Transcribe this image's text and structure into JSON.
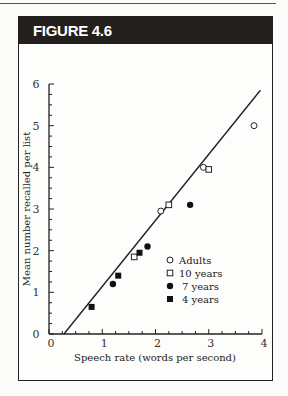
{
  "figure": {
    "label": "FIGURE 4.6"
  },
  "chart_data": {
    "type": "scatter",
    "title": "",
    "xlabel": "Speech rate (words per second)",
    "ylabel": "Mean number recalled per list",
    "xlim": [
      0,
      4
    ],
    "ylim": [
      0,
      6
    ],
    "xticks": [
      "0",
      "1",
      "2",
      "3",
      "4"
    ],
    "yticks": [
      "0",
      "1",
      "2",
      "3",
      "4",
      "5",
      "6"
    ],
    "grid": false,
    "legend_position": "lower right",
    "series": [
      {
        "name": "Adults",
        "marker": "open-circle",
        "points": [
          [
            2.1,
            2.95
          ],
          [
            2.9,
            4.0
          ],
          [
            3.85,
            5.0
          ]
        ]
      },
      {
        "name": "10 years",
        "marker": "open-square",
        "points": [
          [
            1.6,
            1.85
          ],
          [
            2.25,
            3.1
          ],
          [
            3.0,
            3.95
          ]
        ]
      },
      {
        "name": "7 years",
        "marker": "filled-circle",
        "points": [
          [
            1.2,
            1.2
          ],
          [
            1.85,
            2.1
          ],
          [
            2.65,
            3.1
          ]
        ]
      },
      {
        "name": "4 years",
        "marker": "filled-square",
        "points": [
          [
            0.8,
            0.65
          ],
          [
            1.3,
            1.4
          ],
          [
            1.7,
            1.95
          ]
        ]
      }
    ],
    "fit_line": {
      "from": [
        0.28,
        0
      ],
      "to": [
        3.97,
        5.85
      ]
    }
  }
}
